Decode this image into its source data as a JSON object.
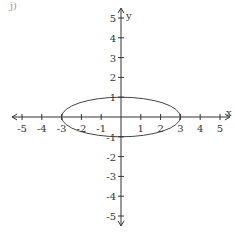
{
  "chart_data": {
    "type": "line",
    "title": "",
    "equation": "x^2/9 + y^2 = 1",
    "xlabel": "x",
    "ylabel": "y",
    "xlim": [
      -5.5,
      5.5
    ],
    "ylim": [
      -5.5,
      5.5
    ],
    "grid": false,
    "legend": null,
    "x_ticks": [
      -5,
      -4,
      -3,
      -2,
      -1,
      1,
      2,
      3,
      4,
      5
    ],
    "y_ticks": [
      5,
      4,
      3,
      2,
      1,
      -1,
      -2,
      -3,
      -4,
      -5
    ],
    "x_tick_labels": [
      "-5",
      "-4",
      "-3",
      "-2",
      "-1",
      "1",
      "2",
      "3",
      "4",
      "5"
    ],
    "y_tick_labels": [
      "5",
      "4",
      "3",
      "2",
      "1",
      "-1",
      "-2",
      "-3",
      "-4",
      "-5"
    ],
    "series": [
      {
        "name": "ellipse",
        "shape": "ellipse",
        "center": [
          0,
          0
        ],
        "semi_axis_x": 3,
        "semi_axis_y": 1,
        "points": [
          [
            -3,
            0
          ],
          [
            0,
            1
          ],
          [
            3,
            0
          ],
          [
            0,
            -1
          ]
        ]
      }
    ]
  },
  "labels": {
    "x_axis": "x",
    "y_axis": "y",
    "corner": "j)"
  },
  "layout": {
    "origin_px": [
      121,
      117
    ],
    "unit_px": 19.8,
    "colors": {
      "axis": "#333333",
      "curve": "#444444"
    }
  }
}
